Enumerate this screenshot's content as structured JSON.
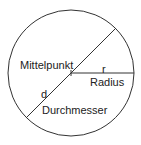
{
  "diagram": {
    "labels": {
      "center": "Mittelpunkt",
      "radius_symbol": "r",
      "radius": "Radius",
      "diameter_symbol": "d",
      "diameter": "Durchmesser"
    },
    "colors": {
      "stroke": "#333333",
      "text": "#222222"
    }
  }
}
